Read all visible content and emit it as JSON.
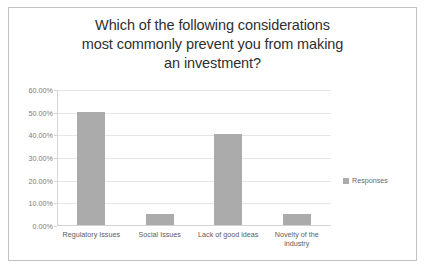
{
  "chart_data": {
    "type": "bar",
    "title": "Which of the following considerations most commonly prevent you from making an investment?",
    "title_lines": [
      "Which of the following considerations",
      "most commonly prevent you from making",
      "an investment?"
    ],
    "categories": [
      "Regulatory Issues",
      "Social Issues",
      "Lack of good ideas",
      "Novelty of the industry"
    ],
    "series": [
      {
        "name": "Responses",
        "values": [
          50.0,
          5.0,
          40.0,
          5.0
        ]
      }
    ],
    "values": [
      50.0,
      5.0,
      40.0,
      5.0
    ],
    "xlabel": "",
    "ylabel": "",
    "ylim": [
      0,
      60
    ],
    "ytick_values": [
      0,
      10,
      20,
      30,
      40,
      50,
      60
    ],
    "ytick_labels": [
      "0.00%",
      "10.00%",
      "20.00%",
      "30.00%",
      "40.00%",
      "50.00%",
      "60.00%"
    ],
    "grid": true,
    "legend": {
      "position": "right",
      "entries": [
        "Responses"
      ]
    },
    "colors": {
      "bar": "#ababab",
      "gridline": "#e6e6e6",
      "border": "#c3c3c3",
      "title_text": "#2f2f2f",
      "axis_text": "#7a7a7a",
      "category_text": "#5d5d5d",
      "background": "#ffffff"
    }
  }
}
